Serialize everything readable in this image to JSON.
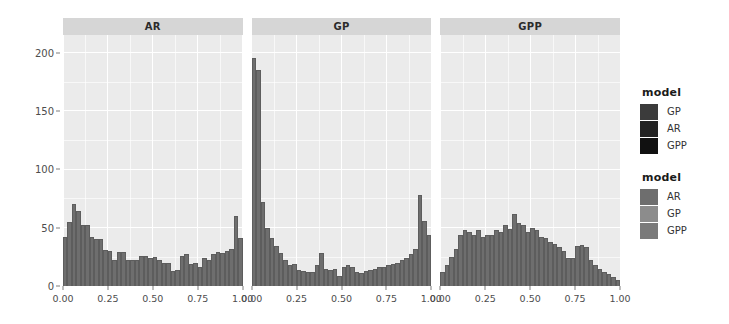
{
  "chart_data": {
    "type": "bar",
    "title": "",
    "xlabel": "",
    "ylabel": "",
    "grid": true,
    "xlim": [
      0,
      1
    ],
    "ylim": [
      0,
      215
    ],
    "y_ticks": [
      0,
      50,
      100,
      150,
      200
    ],
    "y_tick_labels": [
      "0",
      "50",
      "100",
      "150",
      "200"
    ],
    "x_ticks": [
      0.0,
      0.25,
      0.5,
      0.75,
      1.0
    ],
    "x_tick_labels": [
      "0.00",
      "0.25",
      "0.50",
      "0.75",
      "1.00"
    ],
    "bin_width": 0.025,
    "facets": [
      {
        "label": "AR",
        "bin_centers": [
          0.0125,
          0.0375,
          0.0625,
          0.0875,
          0.1125,
          0.1375,
          0.1625,
          0.1875,
          0.2125,
          0.2375,
          0.2625,
          0.2875,
          0.3125,
          0.3375,
          0.3625,
          0.3875,
          0.4125,
          0.4375,
          0.4625,
          0.4875,
          0.5125,
          0.5375,
          0.5625,
          0.5875,
          0.6125,
          0.6375,
          0.6625,
          0.6875,
          0.7125,
          0.7375,
          0.7625,
          0.7875,
          0.8125,
          0.8375,
          0.8625,
          0.8875,
          0.9125,
          0.9375,
          0.9625,
          0.9875
        ],
        "values": [
          42,
          55,
          70,
          64,
          52,
          52,
          42,
          40,
          40,
          31,
          30,
          22,
          29,
          29,
          22,
          22,
          22,
          26,
          26,
          24,
          25,
          22,
          20,
          20,
          13,
          14,
          26,
          27,
          19,
          20,
          16,
          24,
          22,
          27,
          29,
          28,
          30,
          32,
          60,
          41
        ]
      },
      {
        "label": "GP",
        "bin_centers": [
          0.0125,
          0.0375,
          0.0625,
          0.0875,
          0.1125,
          0.1375,
          0.1625,
          0.1875,
          0.2125,
          0.2375,
          0.2625,
          0.2875,
          0.3125,
          0.3375,
          0.3625,
          0.3875,
          0.4125,
          0.4375,
          0.4625,
          0.4875,
          0.5125,
          0.5375,
          0.5625,
          0.5875,
          0.6125,
          0.6375,
          0.6625,
          0.6875,
          0.7125,
          0.7375,
          0.7625,
          0.7875,
          0.8125,
          0.8375,
          0.8625,
          0.8875,
          0.9125,
          0.9375,
          0.9625,
          0.9875
        ],
        "values": [
          195,
          185,
          72,
          50,
          41,
          34,
          28,
          22,
          18,
          19,
          14,
          13,
          12,
          12,
          18,
          28,
          15,
          14,
          15,
          9,
          16,
          18,
          16,
          12,
          11,
          13,
          14,
          15,
          16,
          16,
          18,
          19,
          20,
          22,
          24,
          27,
          32,
          78,
          56,
          44
        ]
      },
      {
        "label": "GPP",
        "bin_centers": [
          0.0125,
          0.0375,
          0.0625,
          0.0875,
          0.1125,
          0.1375,
          0.1625,
          0.1875,
          0.2125,
          0.2375,
          0.2625,
          0.2875,
          0.3125,
          0.3375,
          0.3625,
          0.3875,
          0.4125,
          0.4375,
          0.4625,
          0.4875,
          0.5125,
          0.5375,
          0.5625,
          0.5875,
          0.6125,
          0.6375,
          0.6625,
          0.6875,
          0.7125,
          0.7375,
          0.7625,
          0.7875,
          0.8125,
          0.8375,
          0.8625,
          0.8875,
          0.9125,
          0.9375,
          0.9625,
          0.9875
        ],
        "values": [
          12,
          18,
          25,
          32,
          44,
          48,
          46,
          44,
          48,
          42,
          44,
          44,
          48,
          46,
          52,
          49,
          62,
          54,
          52,
          46,
          50,
          48,
          42,
          41,
          38,
          36,
          33,
          30,
          24,
          24,
          34,
          35,
          33,
          22,
          18,
          15,
          12,
          10,
          8,
          5
        ]
      }
    ]
  },
  "legends": [
    {
      "title": "model",
      "items": [
        {
          "label": "GP",
          "color": "#3b3b3b"
        },
        {
          "label": "AR",
          "color": "#222222"
        },
        {
          "label": "GPP",
          "color": "#111111"
        }
      ]
    },
    {
      "title": "model",
      "items": [
        {
          "label": "AR",
          "color": "#6e6e6e"
        },
        {
          "label": "GP",
          "color": "#8c8c8c"
        },
        {
          "label": "GPP",
          "color": "#7a7a7a"
        }
      ]
    }
  ],
  "colors": {
    "bar_fill": "#6e6e6e",
    "panel_bg": "#ebebeb",
    "strip_bg": "#d6d6d6",
    "grid": "#ffffff",
    "text": "#4d4d4d"
  }
}
